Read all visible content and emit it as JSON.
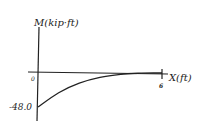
{
  "chart_data": {
    "type": "line",
    "title": "",
    "xlabel": "X(ft)",
    "ylabel": "M(kip·ft)",
    "x_ticks": [
      "0",
      "6"
    ],
    "y_ticks": [
      "-48.0"
    ],
    "xlim": [
      0,
      6
    ],
    "ylim": [
      -48,
      0
    ],
    "grid": false,
    "legend": null,
    "series": [
      {
        "name": "Bending moment",
        "x": [
          0,
          1,
          2,
          3,
          4,
          5,
          6
        ],
        "values": [
          -48.0,
          -27.8,
          -14.2,
          -6.0,
          -1.8,
          -0.2,
          0.0
        ]
      }
    ],
    "style": "hand-drawn"
  },
  "labels": {
    "ylabel": "M(kip·ft)",
    "xlabel": "X(ft)",
    "origin": "0",
    "xtick_end": "6",
    "ymin": "-48.0"
  },
  "colors": {
    "ink": "#222222",
    "background": "#ffffff"
  }
}
